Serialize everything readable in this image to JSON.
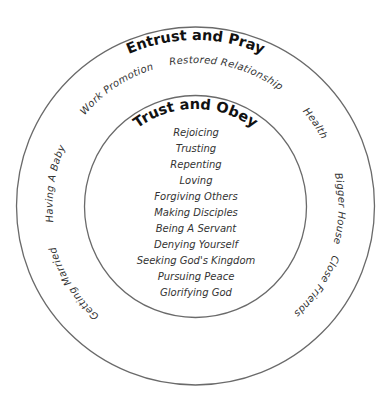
{
  "diagram": {
    "outer_ring": {
      "title": "Entrust and Pray",
      "labels": [
        "Restored Relationship",
        "Work Promotion",
        "Health",
        "Having A Baby",
        "Bigger House",
        "Getting Married",
        "Close Friends"
      ]
    },
    "inner_circle": {
      "title": "Trust and Obey",
      "items": [
        "Rejoicing",
        "Trusting",
        "Repenting",
        "Loving",
        "Forgiving Others",
        "Making Disciples",
        "Being A Servant",
        "Denying Yourself",
        "Seeking God's Kingdom",
        "Pursuing Peace",
        "Glorifying God"
      ]
    },
    "colors": {
      "ring_stroke": "#6a6a6a",
      "title_text": "#111111",
      "label_text": "#333333",
      "background": "#ffffff"
    }
  }
}
